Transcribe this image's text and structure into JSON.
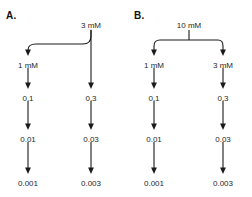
{
  "figure": {
    "background_color": "#ffffff",
    "line_color": "#1a1a1a",
    "text_color": "#1f1f1f",
    "type": "serial-dilution-diagram",
    "panels": [
      {
        "id": "a",
        "label": "A.",
        "top_source": {
          "value": "3 mM",
          "x": 91,
          "y": 22
        },
        "branch_style": "curved-offshoot",
        "columns": [
          {
            "id": "left",
            "x": 28,
            "nodes": [
              {
                "value": "1 mM",
                "y": 62
              },
              {
                "value": "0.1",
                "y": 95
              },
              {
                "value": "0.01",
                "y": 136
              },
              {
                "value": "0.001",
                "y": 180
              }
            ]
          },
          {
            "id": "right",
            "x": 91,
            "nodes": [
              {
                "value": "0.3",
                "y": 95
              },
              {
                "value": "0.03",
                "y": 136
              },
              {
                "value": "0.003",
                "y": 180
              }
            ]
          }
        ]
      },
      {
        "id": "b",
        "label": "B.",
        "top_source": {
          "value": "10 mM",
          "x": 63,
          "y": 22
        },
        "branch_style": "symmetric-bracket",
        "columns": [
          {
            "id": "left",
            "x": 28,
            "nodes": [
              {
                "value": "1 mM",
                "y": 62
              },
              {
                "value": "0.1",
                "y": 95
              },
              {
                "value": "0.01",
                "y": 136
              },
              {
                "value": "0.001",
                "y": 180
              }
            ]
          },
          {
            "id": "right",
            "x": 97,
            "nodes": [
              {
                "value": "3 mM",
                "y": 62
              },
              {
                "value": "0.3",
                "y": 95
              },
              {
                "value": "0.03",
                "y": 136
              },
              {
                "value": "0.003",
                "y": 180
              }
            ]
          }
        ]
      }
    ]
  }
}
